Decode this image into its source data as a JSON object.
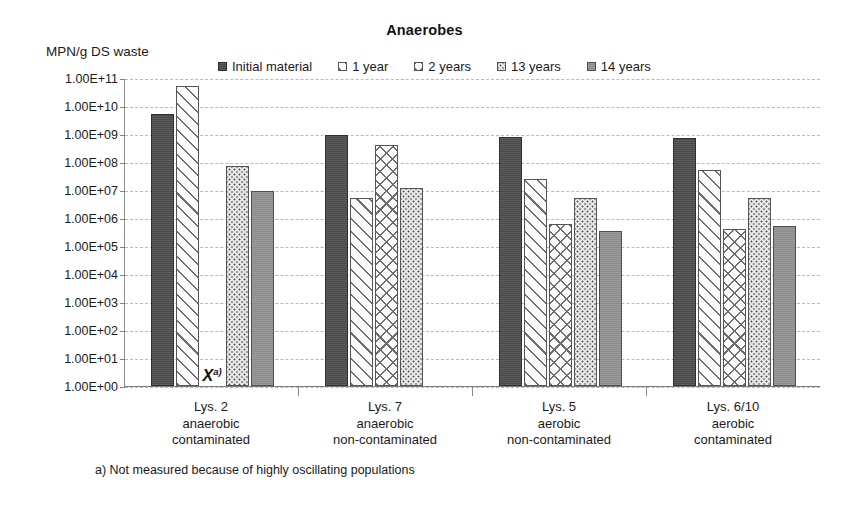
{
  "chart_data": {
    "type": "bar",
    "title": "Anaerobes",
    "ylabel": "MPN/g DS waste",
    "xlabel": "",
    "scale": "log10",
    "ylim": [
      1,
      100000000000.0
    ],
    "grid": true,
    "legend_position": "top",
    "ytick_labels": [
      "1.00E+11",
      "1.00E+10",
      "1.00E+09",
      "1.00E+08",
      "1.00E+07",
      "1.00E+06",
      "1.00E+05",
      "1.00E+04",
      "1.00E+03",
      "1.00E+02",
      "1.00E+01",
      "1.00E+00"
    ],
    "ytick_values": [
      100000000000.0,
      10000000000.0,
      1000000000.0,
      100000000.0,
      10000000.0,
      1000000.0,
      100000.0,
      10000.0,
      1000.0,
      100.0,
      10.0,
      1.0
    ],
    "categories": [
      "Lys. 2 anaerobic contaminated",
      "Lys. 7 anaerobic non-contaminated",
      "Lys. 5 aerobic non-contaminated",
      "Lys. 6/10 aerobic contaminated"
    ],
    "category_lines": [
      [
        "Lys. 2",
        "anaerobic",
        "contaminated"
      ],
      [
        "Lys. 7",
        "anaerobic",
        "non-contaminated"
      ],
      [
        "Lys. 5",
        "aerobic",
        "non-contaminated"
      ],
      [
        "Lys. 6/10",
        "aerobic",
        "contaminated"
      ]
    ],
    "series": [
      {
        "name": "Initial material",
        "swatch": "solid-dark",
        "values": [
          5000000000.0,
          900000000.0,
          800000000.0,
          700000000.0
        ]
      },
      {
        "name": "1 year",
        "swatch": "diagonal-hatch",
        "values": [
          50000000000.0,
          5000000.0,
          25000000.0,
          50000000.0
        ]
      },
      {
        "name": "2 years",
        "swatch": "cross-hatch",
        "values": [
          null,
          400000000.0,
          600000.0,
          400000.0
        ]
      },
      {
        "name": "13 years",
        "swatch": "dotted",
        "values": [
          70000000.0,
          12000000.0,
          5000000.0,
          5000000.0
        ]
      },
      {
        "name": "14 years",
        "swatch": "solid-gray",
        "values": [
          9000000.0,
          null,
          350000.0,
          500000.0
        ]
      }
    ],
    "annotations": [
      {
        "label": "X",
        "superscript": "a)",
        "category": "Lys. 2 anaerobic contaminated",
        "series": "2 years",
        "note": "Not measured"
      }
    ],
    "footnote": "a) Not measured because of highly oscillating populations"
  },
  "colors": {
    "initial_material": "#4a4a4a",
    "fourteen_years": "#8c8c8c",
    "hatch_stroke": "#6e6e6e",
    "gridline": "#b9b9b9",
    "axis": "#7f7f7f",
    "text": "#1a1a1a"
  }
}
